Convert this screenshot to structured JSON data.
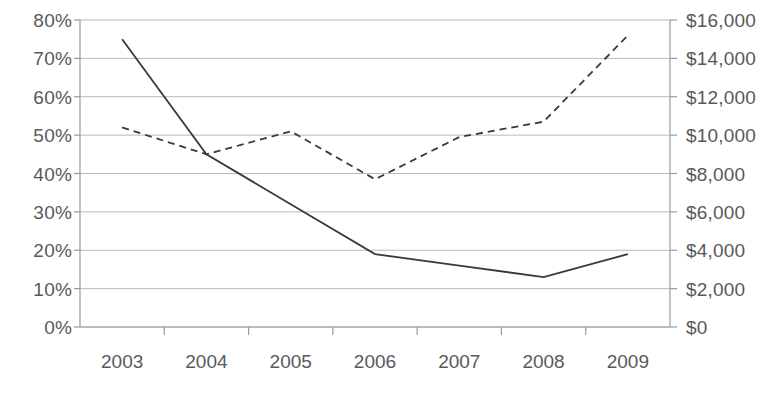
{
  "chart_data": {
    "type": "line",
    "title": "",
    "subtitle": "",
    "xlabel": "",
    "categories": [
      "2003",
      "2004",
      "2005",
      "2006",
      "2007",
      "2008",
      "2009"
    ],
    "grid": true,
    "legend_position": "none",
    "axes": {
      "left": {
        "label": "",
        "ylim": [
          0,
          80
        ],
        "tick_step": 10,
        "ticks": [
          0,
          10,
          20,
          30,
          40,
          50,
          60,
          70,
          80
        ],
        "tick_labels": [
          "0%",
          "10%",
          "20%",
          "30%",
          "40%",
          "50%",
          "60%",
          "70%",
          "80%"
        ],
        "format": "percent"
      },
      "right": {
        "label": "",
        "ylim": [
          0,
          16000
        ],
        "tick_step": 2000,
        "ticks": [
          0,
          2000,
          4000,
          6000,
          8000,
          10000,
          12000,
          14000,
          16000
        ],
        "tick_labels": [
          "$0",
          "$2,000",
          "$4,000",
          "$6,000",
          "$8,000",
          "$10,000",
          "$12,000",
          "$14,000",
          "$16,000"
        ],
        "format": "currency"
      }
    },
    "series": [
      {
        "name": "Percentage series",
        "axis": "left",
        "style": "solid",
        "color": "#3a3a3a",
        "values": [
          75,
          45,
          32,
          19,
          16,
          13,
          19
        ]
      },
      {
        "name": "Dollar series",
        "axis": "right",
        "style": "dashed",
        "color": "#3a3a3a",
        "values": [
          10400,
          9000,
          10200,
          7700,
          9900,
          10700,
          15200
        ]
      }
    ]
  },
  "colors": {
    "axis": "#9a9a9a",
    "gridline": "#b9b9b9",
    "series_line": "#3a3a3a",
    "tick_text": "#59595b",
    "background": "#ffffff"
  },
  "geometry": {
    "plot_left": 80,
    "plot_right": 670,
    "plot_top": 20,
    "plot_bottom": 327
  }
}
